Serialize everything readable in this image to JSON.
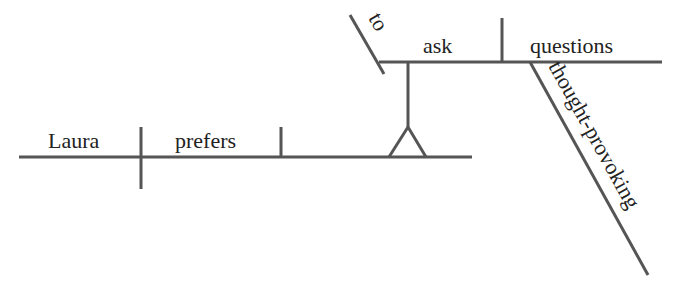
{
  "diagram": {
    "type": "sentence-diagram",
    "sentence": "Laura prefers to ask thought-provoking questions",
    "line_color": "#555555",
    "text_color": "#222222",
    "words": {
      "subject": "Laura",
      "verb": "prefers",
      "infinitive_marker": "to",
      "infinitive_verb": "ask",
      "infinitive_object": "questions",
      "modifier": "thought-provoking"
    }
  }
}
